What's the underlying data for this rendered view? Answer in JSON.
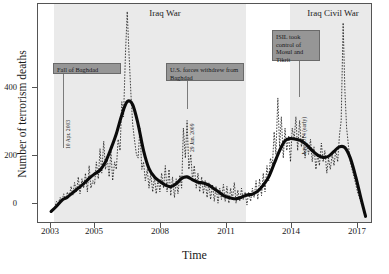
{
  "chart_data": {
    "type": "line",
    "title": "",
    "xlabel": "Time",
    "ylabel": "Number of terrorism deaths",
    "xlim": [
      2002.4,
      2017.7
    ],
    "ylim": [
      -20,
      560
    ],
    "yticks": [
      0,
      200,
      400
    ],
    "xticks": [
      2003,
      2005,
      2008,
      2011,
      2014,
      2017
    ],
    "grid": false,
    "legend": "none",
    "series": [
      {
        "name": "Monthly terrorism deaths",
        "style": "dotted",
        "x": [
          2003.0,
          2003.08,
          2003.17,
          2003.25,
          2003.33,
          2003.42,
          2003.5,
          2003.58,
          2003.67,
          2003.75,
          2003.83,
          2003.92,
          2004.0,
          2004.08,
          2004.17,
          2004.25,
          2004.33,
          2004.42,
          2004.5,
          2004.58,
          2004.67,
          2004.75,
          2004.83,
          2004.92,
          2005.0,
          2005.08,
          2005.17,
          2005.25,
          2005.33,
          2005.42,
          2005.5,
          2005.58,
          2005.67,
          2005.75,
          2005.83,
          2005.92,
          2006.0,
          2006.08,
          2006.17,
          2006.25,
          2006.33,
          2006.42,
          2006.5,
          2006.58,
          2006.67,
          2006.75,
          2006.83,
          2006.92,
          2007.0,
          2007.08,
          2007.17,
          2007.25,
          2007.33,
          2007.42,
          2007.5,
          2007.58,
          2007.67,
          2007.75,
          2007.83,
          2007.92,
          2008.0,
          2008.08,
          2008.17,
          2008.25,
          2008.33,
          2008.42,
          2008.5,
          2008.58,
          2008.67,
          2008.75,
          2008.83,
          2008.92,
          2009.0,
          2009.08,
          2009.17,
          2009.25,
          2009.33,
          2009.42,
          2009.5,
          2009.58,
          2009.67,
          2009.75,
          2009.83,
          2009.92,
          2010.0,
          2010.08,
          2010.17,
          2010.25,
          2010.33,
          2010.42,
          2010.5,
          2010.58,
          2010.67,
          2010.75,
          2010.83,
          2010.92,
          2011.0,
          2011.08,
          2011.17,
          2011.25,
          2011.33,
          2011.42,
          2011.5,
          2011.58,
          2011.67,
          2011.75,
          2011.83,
          2011.92,
          2012.0,
          2012.08,
          2012.17,
          2012.25,
          2012.33,
          2012.42,
          2012.5,
          2012.58,
          2012.67,
          2012.75,
          2012.83,
          2012.92,
          2013.0,
          2013.08,
          2013.17,
          2013.25,
          2013.33,
          2013.42,
          2013.5,
          2013.58,
          2013.67,
          2013.75,
          2013.83,
          2013.92,
          2014.0,
          2014.08,
          2014.17,
          2014.25,
          2014.33,
          2014.42,
          2014.5,
          2014.58,
          2014.67,
          2014.75,
          2014.83,
          2014.92,
          2015.0,
          2015.08,
          2015.17,
          2015.25,
          2015.33,
          2015.42,
          2015.5,
          2015.58,
          2015.67,
          2015.75,
          2015.83,
          2015.92,
          2016.0,
          2016.08,
          2016.17,
          2016.25,
          2016.33,
          2016.42,
          2016.5,
          2016.58,
          2016.67,
          2016.75,
          2016.83,
          2016.92,
          2017.0,
          2017.08,
          2017.17,
          2017.25,
          2017.33,
          2017.42
        ],
        "y": [
          5,
          8,
          20,
          35,
          30,
          45,
          35,
          55,
          40,
          60,
          45,
          75,
          50,
          85,
          60,
          100,
          55,
          95,
          70,
          110,
          60,
          130,
          70,
          90,
          80,
          140,
          95,
          175,
          110,
          195,
          120,
          150,
          100,
          170,
          90,
          140,
          120,
          200,
          170,
          300,
          260,
          430,
          540,
          430,
          320,
          240,
          200,
          160,
          150,
          230,
          120,
          140,
          90,
          120,
          70,
          110,
          60,
          100,
          55,
          95,
          60,
          110,
          70,
          130,
          60,
          120,
          50,
          100,
          45,
          95,
          55,
          105,
          70,
          230,
          150,
          250,
          120,
          160,
          90,
          130,
          70,
          110,
          60,
          100,
          55,
          90,
          45,
          85,
          40,
          80,
          35,
          75,
          30,
          70,
          40,
          80,
          35,
          75,
          30,
          70,
          40,
          85,
          30,
          65,
          35,
          70,
          40,
          60,
          25,
          60,
          35,
          70,
          45,
          90,
          40,
          95,
          50,
          110,
          60,
          130,
          90,
          150,
          130,
          220,
          160,
          310,
          180,
          260,
          150,
          230,
          170,
          210,
          140,
          230,
          200,
          260,
          170,
          250,
          180,
          210,
          150,
          190,
          160,
          200,
          140,
          180,
          120,
          160,
          130,
          190,
          140,
          170,
          110,
          150,
          120,
          160,
          130,
          170,
          140,
          210,
          250,
          510,
          330,
          230,
          180,
          140,
          120,
          100,
          80,
          60,
          45,
          30,
          20,
          10
        ]
      },
      {
        "name": "Smoothed trend",
        "style": "solid",
        "x": [
          2003.0,
          2003.25,
          2003.5,
          2003.75,
          2004.0,
          2004.25,
          2004.5,
          2004.75,
          2005.0,
          2005.25,
          2005.5,
          2005.75,
          2006.0,
          2006.25,
          2006.5,
          2006.75,
          2007.0,
          2007.25,
          2007.5,
          2007.75,
          2008.0,
          2008.25,
          2008.5,
          2008.75,
          2009.0,
          2009.25,
          2009.5,
          2009.75,
          2010.0,
          2010.25,
          2010.5,
          2010.75,
          2011.0,
          2011.25,
          2011.5,
          2011.75,
          2012.0,
          2012.25,
          2012.5,
          2012.75,
          2013.0,
          2013.25,
          2013.5,
          2013.75,
          2014.0,
          2014.25,
          2014.5,
          2014.75,
          2015.0,
          2015.25,
          2015.5,
          2015.75,
          2016.0,
          2016.25,
          2016.5,
          2016.75,
          2017.0,
          2017.25,
          2017.45
        ],
        "y": [
          8,
          22,
          38,
          46,
          58,
          70,
          82,
          96,
          108,
          118,
          140,
          175,
          215,
          265,
          300,
          292,
          240,
          170,
          122,
          100,
          88,
          78,
          74,
          82,
          96,
          100,
          92,
          86,
          84,
          78,
          68,
          58,
          48,
          44,
          42,
          46,
          52,
          54,
          62,
          78,
          100,
          135,
          170,
          196,
          202,
          200,
          196,
          185,
          170,
          158,
          152,
          155,
          168,
          180,
          178,
          150,
          100,
          40,
          -5
        ]
      }
    ],
    "bands": [
      {
        "label": "Iraq War",
        "x0": 2003.12,
        "x1": 2011.9,
        "color": "#eaeaea"
      },
      {
        "label": "Iraq Civil War",
        "x0": 2013.9,
        "x1": 2017.6,
        "color": "#eaeaea"
      }
    ],
    "annotations": [
      {
        "text": "Fall of Baghdad",
        "date_text": "10 Apr. 2003",
        "x": 2003.27
      },
      {
        "text": "U.S. forces withdrew from Baghdad",
        "date_text": "29 Jan. 2009",
        "x": 2009.08
      },
      {
        "text": "ISIL took control of Mosul and Tikrit",
        "date_text": "Jun. 2014 (early)",
        "x": 2014.42
      }
    ]
  },
  "axis": {
    "y_tick_labels": [
      "0",
      "200",
      "400"
    ],
    "x_tick_labels": [
      "2003",
      "2005",
      "2008",
      "2011",
      "2014",
      "2017"
    ],
    "y_title": "Number of terrorism deaths",
    "x_title": "Time"
  },
  "eras": {
    "iraq_war": "Iraq War",
    "iraq_civil_war": "Iraq Civil War"
  },
  "annotations": {
    "a1_label": "Fall of Baghdad",
    "a1_date": "10 Apr. 2003",
    "a2_label": "U.S. forces withdrew from Baghdad",
    "a2_date": "29 Jan. 2009",
    "a3_label": "ISIL took control of Mosul and Tikrit",
    "a3_date": "Jun. 2014 (early)"
  },
  "colors": {
    "band": "#eaeaea",
    "callout": "#969696",
    "line": "#111111",
    "frame": "#555555"
  }
}
